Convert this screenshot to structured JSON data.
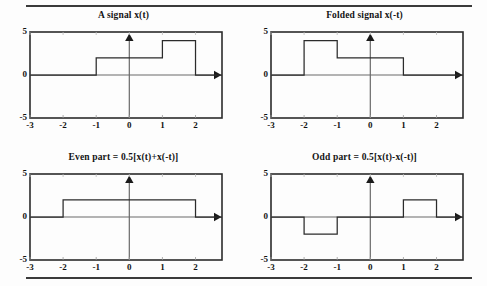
{
  "figure": {
    "title_top_rule": "horizontal-rule",
    "background": "#fdfdfd",
    "line_color": "#2b2b2b",
    "axis_color": "#5a5a5a"
  },
  "chart_data": [
    {
      "type": "line",
      "id": "a-signal",
      "title": "A signal  x(t)",
      "xlabel": "",
      "ylabel": "",
      "xlim": [
        -3,
        2.8
      ],
      "ylim": [
        -5,
        5
      ],
      "xticks": [
        -3,
        -2,
        -1,
        0,
        1,
        2
      ],
      "xtick_labels": [
        "-3",
        "-2",
        "-1",
        "0",
        "1",
        "2"
      ],
      "yticks": [
        -5,
        0,
        5
      ],
      "ytick_labels": [
        "-5",
        "0",
        "5"
      ],
      "grid": false,
      "legend": "none",
      "steps": [
        {
          "from": -3,
          "to": -1,
          "value": 0
        },
        {
          "from": -1,
          "to": 1,
          "value": 2
        },
        {
          "from": 1,
          "to": 2,
          "value": 4
        },
        {
          "from": 2,
          "to": 2.8,
          "value": 0
        }
      ],
      "annotations": [
        "vertical-axis-arrow-up-at-t=0",
        "horizontal-axis-arrow-right"
      ]
    },
    {
      "type": "line",
      "id": "folded-signal",
      "title": "Folded signal  x(-t)",
      "xlabel": "",
      "ylabel": "",
      "xlim": [
        -3,
        2.8
      ],
      "ylim": [
        -5,
        5
      ],
      "xticks": [
        -3,
        -2,
        -1,
        0,
        1,
        2
      ],
      "xtick_labels": [
        "-3",
        "-2",
        "-1",
        "0",
        "1",
        "2"
      ],
      "yticks": [
        -5,
        0,
        5
      ],
      "ytick_labels": [
        "-5",
        "0",
        "5"
      ],
      "grid": false,
      "legend": "none",
      "steps": [
        {
          "from": -3,
          "to": -2,
          "value": 0
        },
        {
          "from": -2,
          "to": -1,
          "value": 4
        },
        {
          "from": -1,
          "to": 1,
          "value": 2
        },
        {
          "from": 1,
          "to": 2.8,
          "value": 0
        }
      ],
      "annotations": [
        "vertical-axis-arrow-up-at-t=0",
        "horizontal-axis-arrow-right"
      ]
    },
    {
      "type": "line",
      "id": "even-part",
      "title": "Even part  =  0.5[x(t)+x(-t)]",
      "xlabel": "",
      "ylabel": "",
      "xlim": [
        -3,
        2.8
      ],
      "ylim": [
        -5,
        5
      ],
      "xticks": [
        -3,
        -2,
        -1,
        0,
        1,
        2
      ],
      "xtick_labels": [
        "-3",
        "-2",
        "-1",
        "0",
        "1",
        "2"
      ],
      "yticks": [
        -5,
        0,
        5
      ],
      "ytick_labels": [
        "-5",
        "0",
        "5"
      ],
      "grid": false,
      "legend": "none",
      "steps": [
        {
          "from": -3,
          "to": -2,
          "value": 0
        },
        {
          "from": -2,
          "to": 2,
          "value": 2
        },
        {
          "from": 2,
          "to": 2.8,
          "value": 0
        }
      ],
      "annotations": [
        "vertical-axis-arrow-up-at-t=0",
        "horizontal-axis-arrow-right"
      ]
    },
    {
      "type": "line",
      "id": "odd-part",
      "title": "Odd part  =  0.5[x(t)-x(-t)]",
      "xlabel": "",
      "ylabel": "",
      "xlim": [
        -3,
        2.8
      ],
      "ylim": [
        -5,
        5
      ],
      "xticks": [
        -3,
        -2,
        -1,
        0,
        1,
        2
      ],
      "xtick_labels": [
        "-3",
        "-2",
        "-1",
        "0",
        "1",
        "2"
      ],
      "yticks": [
        -5,
        0,
        5
      ],
      "ytick_labels": [
        "-5",
        "0",
        "5"
      ],
      "grid": false,
      "legend": "none",
      "steps": [
        {
          "from": -3,
          "to": -2,
          "value": 0
        },
        {
          "from": -2,
          "to": -1,
          "value": -2
        },
        {
          "from": -1,
          "to": 1,
          "value": 0
        },
        {
          "from": 1,
          "to": 2,
          "value": 2
        },
        {
          "from": 2,
          "to": 2.8,
          "value": 0
        }
      ],
      "annotations": [
        "vertical-axis-arrow-up-at-t=0",
        "horizontal-axis-arrow-right"
      ]
    }
  ]
}
